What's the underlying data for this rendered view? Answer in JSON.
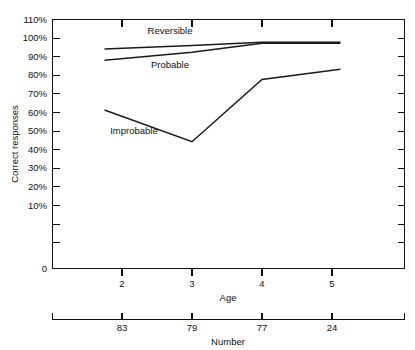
{
  "chart_data": {
    "type": "line",
    "title": "",
    "xlabel": "Age",
    "ylabel": "Correct responses",
    "x": [
      2,
      3,
      4,
      5
    ],
    "xtick_labels": [
      "2",
      "3",
      "4",
      "5"
    ],
    "ylim": [
      0,
      110
    ],
    "ytick_values": [
      0,
      10,
      20,
      30,
      40,
      50,
      60,
      70,
      80,
      90,
      100,
      110
    ],
    "ytick_labels": [
      "0",
      "10%",
      "20%",
      "30%",
      "40%",
      "50%",
      "60%",
      "70%",
      "80%",
      "90%",
      "100%",
      "110%"
    ],
    "grid": false,
    "legend": "inline-labels",
    "series": [
      {
        "name": "Reversible",
        "label": "Reversible",
        "values": [
          97,
          98.5,
          100,
          100
        ],
        "x_start_offset": -0.25,
        "x_end_offset": 0.12
      },
      {
        "name": "Probable",
        "label": "Probable",
        "values": [
          92,
          95.5,
          99.5,
          99.5
        ],
        "x_start_offset": -0.25,
        "x_end_offset": 0.12
      },
      {
        "name": "Improbable",
        "label": "Improbable",
        "values": [
          70,
          56,
          83.5,
          88
        ],
        "x_start_offset": -0.25,
        "x_end_offset": 0.12
      }
    ],
    "secondary_axis": {
      "label": "Number",
      "tick_labels": [
        "83",
        "79",
        "77",
        "24"
      ],
      "values": [
        83,
        79,
        77,
        24
      ]
    }
  },
  "axes": {
    "y_title": "Correct responses",
    "x_title": "Age",
    "n_title": "Number"
  },
  "labels": {
    "reversible": "Reversible",
    "probable": "Probable",
    "improbable": "Improbable"
  },
  "colors": {
    "ink": "#111111",
    "background": "#ffffff"
  }
}
